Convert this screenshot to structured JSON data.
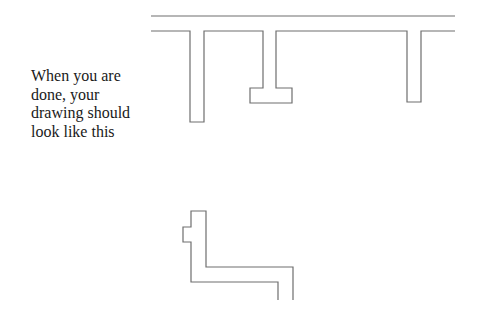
{
  "instruction": {
    "lines": [
      "When you are",
      "done, your",
      "drawing should",
      "look like this"
    ]
  },
  "drawing": {
    "stroke_color": "#6e6e6e",
    "top_figure": {
      "top_line": {
        "x1": 151,
        "x2": 455,
        "y": 16
      },
      "inner_outline": [
        [
          151,
          31
        ],
        [
          190,
          31
        ],
        [
          190,
          122
        ],
        [
          204,
          122
        ],
        [
          204,
          31
        ],
        [
          263,
          31
        ],
        [
          263,
          88
        ],
        [
          250,
          88
        ],
        [
          250,
          103
        ],
        [
          292,
          103
        ],
        [
          292,
          88
        ],
        [
          276,
          88
        ],
        [
          276,
          31
        ],
        [
          407,
          31
        ],
        [
          407,
          102
        ],
        [
          421,
          102
        ],
        [
          421,
          31
        ],
        [
          455,
          31
        ]
      ]
    },
    "bottom_figure": {
      "outline": [
        [
          278,
          300
        ],
        [
          278,
          282
        ],
        [
          191,
          282
        ],
        [
          191,
          242
        ],
        [
          183,
          242
        ],
        [
          183,
          227
        ],
        [
          191,
          227
        ],
        [
          191,
          211
        ],
        [
          206,
          211
        ],
        [
          206,
          267
        ],
        [
          293,
          267
        ],
        [
          293,
          300
        ]
      ]
    }
  }
}
